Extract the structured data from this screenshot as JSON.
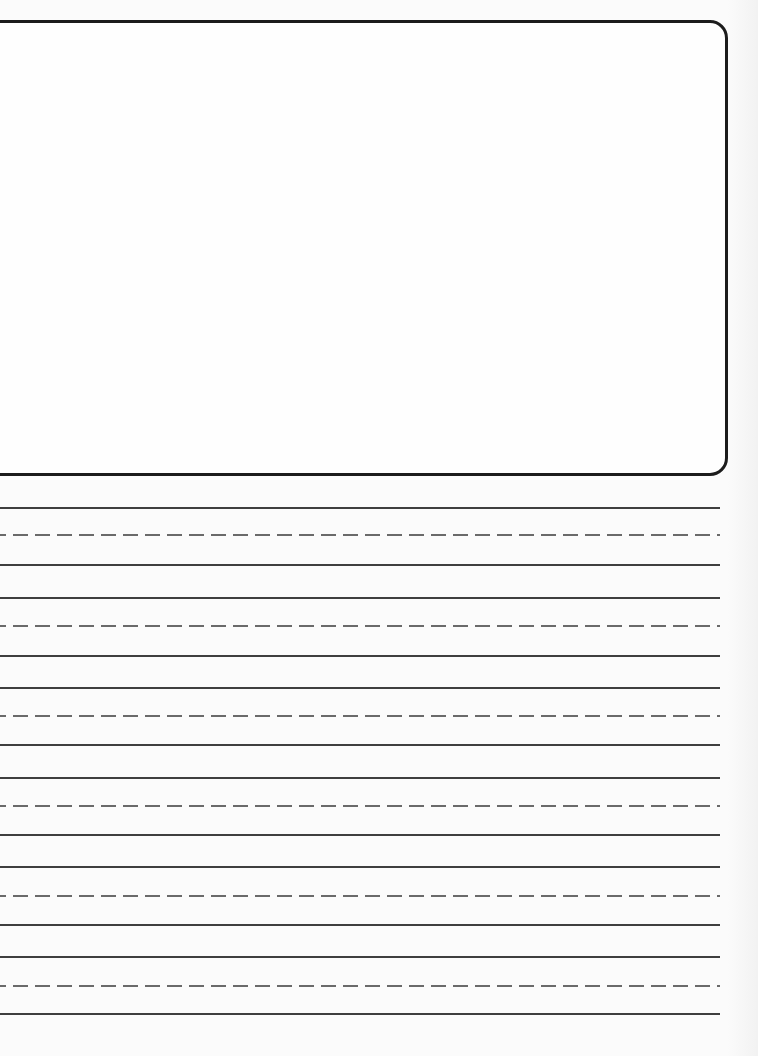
{
  "worksheet": {
    "type": "handwriting-practice",
    "drawing_box": {
      "label": ""
    },
    "line_groups": [
      {
        "top": 507,
        "mid": 534,
        "bottom": 564
      },
      {
        "top": 597,
        "mid": 625,
        "bottom": 655
      },
      {
        "top": 687,
        "mid": 715,
        "bottom": 744
      },
      {
        "top": 777,
        "mid": 805,
        "bottom": 834
      },
      {
        "top": 866,
        "mid": 895,
        "bottom": 924
      },
      {
        "top": 956,
        "mid": 985,
        "bottom": 1013
      }
    ],
    "colors": {
      "box_border": "#1c1c1c",
      "solid_line": "#3f3f3f",
      "dashed_line": "#6a6a6a",
      "paper": "#fbfbfb"
    }
  }
}
